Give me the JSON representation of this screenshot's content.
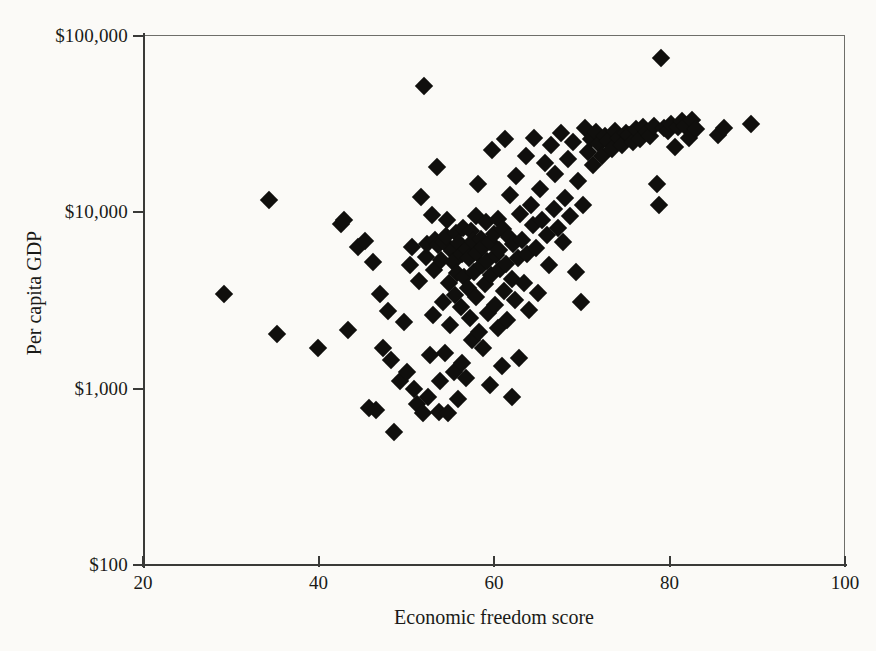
{
  "chart_data": {
    "type": "scatter",
    "title": "",
    "xlabel": "Economic freedom score",
    "ylabel": "Per capita GDP",
    "xlim": [
      20,
      100
    ],
    "ylim": [
      100,
      100000
    ],
    "yscale": "log",
    "xscale": "linear",
    "grid": false,
    "legend": null,
    "marker": "diamond",
    "marker_color": "#100f0d",
    "xticks": [
      20,
      40,
      60,
      80,
      100
    ],
    "xtick_labels": [
      "20",
      "40",
      "60",
      "80",
      "100"
    ],
    "yticks": [
      100,
      1000,
      10000,
      100000
    ],
    "ytick_labels": [
      "$100",
      "$1,000",
      "$10,000",
      "$100,000"
    ],
    "n_points": 178,
    "points": [
      [
        29.2,
        3450
      ],
      [
        34.4,
        11800
      ],
      [
        35.3,
        2050
      ],
      [
        39.9,
        1700
      ],
      [
        42.6,
        8600
      ],
      [
        42.9,
        9000
      ],
      [
        43.4,
        2150
      ],
      [
        44.5,
        6400
      ],
      [
        45.3,
        6900
      ],
      [
        45.7,
        780
      ],
      [
        46.2,
        5200
      ],
      [
        46.6,
        760
      ],
      [
        47.0,
        3450
      ],
      [
        47.4,
        1700
      ],
      [
        47.9,
        2750
      ],
      [
        48.3,
        1450
      ],
      [
        48.6,
        570
      ],
      [
        49.3,
        1100
      ],
      [
        49.8,
        2400
      ],
      [
        50.1,
        1250
      ],
      [
        50.4,
        5000
      ],
      [
        50.6,
        6400
      ],
      [
        50.9,
        1000
      ],
      [
        51.2,
        820
      ],
      [
        51.5,
        4100
      ],
      [
        51.7,
        12200
      ],
      [
        51.9,
        730
      ],
      [
        52.0,
        52000
      ],
      [
        52.2,
        5600
      ],
      [
        52.4,
        6600
      ],
      [
        52.5,
        900
      ],
      [
        52.7,
        1550
      ],
      [
        52.9,
        9600
      ],
      [
        53.0,
        2600
      ],
      [
        53.2,
        4700
      ],
      [
        53.3,
        7000
      ],
      [
        53.5,
        18000
      ],
      [
        53.6,
        6500
      ],
      [
        53.7,
        740
      ],
      [
        53.9,
        1100
      ],
      [
        54.0,
        5400
      ],
      [
        54.2,
        3100
      ],
      [
        54.3,
        6800
      ],
      [
        54.4,
        1600
      ],
      [
        54.5,
        7300
      ],
      [
        54.7,
        9000
      ],
      [
        54.8,
        730
      ],
      [
        54.9,
        4000
      ],
      [
        55.0,
        2300
      ],
      [
        55.2,
        6000
      ],
      [
        55.3,
        5200
      ],
      [
        55.4,
        1250
      ],
      [
        55.6,
        3400
      ],
      [
        55.7,
        7600
      ],
      [
        55.8,
        4500
      ],
      [
        55.9,
        870
      ],
      [
        56.0,
        6700
      ],
      [
        56.2,
        2900
      ],
      [
        56.3,
        5800
      ],
      [
        56.4,
        1400
      ],
      [
        56.5,
        8200
      ],
      [
        56.6,
        4300
      ],
      [
        56.8,
        1150
      ],
      [
        56.9,
        6200
      ],
      [
        57.0,
        3700
      ],
      [
        57.1,
        5500
      ],
      [
        57.3,
        2500
      ],
      [
        57.4,
        7800
      ],
      [
        57.5,
        1900
      ],
      [
        57.6,
        6900
      ],
      [
        57.7,
        4600
      ],
      [
        57.9,
        9500
      ],
      [
        58.0,
        3300
      ],
      [
        58.1,
        5900
      ],
      [
        58.2,
        14500
      ],
      [
        58.3,
        2100
      ],
      [
        58.5,
        7100
      ],
      [
        58.6,
        5000
      ],
      [
        58.7,
        1700
      ],
      [
        58.8,
        6400
      ],
      [
        59.0,
        3900
      ],
      [
        59.1,
        8800
      ],
      [
        59.2,
        5300
      ],
      [
        59.3,
        2700
      ],
      [
        59.5,
        6800
      ],
      [
        59.6,
        1050
      ],
      [
        59.7,
        4400
      ],
      [
        59.8,
        22500
      ],
      [
        60.0,
        7500
      ],
      [
        60.1,
        3000
      ],
      [
        60.2,
        5700
      ],
      [
        60.4,
        9200
      ],
      [
        60.5,
        2200
      ],
      [
        60.6,
        6100
      ],
      [
        60.7,
        4800
      ],
      [
        60.9,
        1350
      ],
      [
        61.0,
        8000
      ],
      [
        61.1,
        3600
      ],
      [
        61.3,
        26000
      ],
      [
        61.4,
        5100
      ],
      [
        61.5,
        2450
      ],
      [
        61.7,
        7200
      ],
      [
        61.8,
        12500
      ],
      [
        62.0,
        4200
      ],
      [
        62.1,
        900
      ],
      [
        62.2,
        6600
      ],
      [
        62.4,
        3200
      ],
      [
        62.5,
        16000
      ],
      [
        62.7,
        5500
      ],
      [
        62.8,
        1500
      ],
      [
        63.0,
        9800
      ],
      [
        63.2,
        7000
      ],
      [
        63.4,
        4000
      ],
      [
        63.6,
        21000
      ],
      [
        63.8,
        5800
      ],
      [
        64.0,
        2800
      ],
      [
        64.2,
        11000
      ],
      [
        64.4,
        8500
      ],
      [
        64.6,
        26500
      ],
      [
        64.8,
        6300
      ],
      [
        65.0,
        3500
      ],
      [
        65.2,
        13500
      ],
      [
        65.5,
        9000
      ],
      [
        65.8,
        19000
      ],
      [
        66.0,
        7400
      ],
      [
        66.3,
        5000
      ],
      [
        66.5,
        24000
      ],
      [
        66.8,
        10500
      ],
      [
        67.0,
        16500
      ],
      [
        67.3,
        8200
      ],
      [
        67.6,
        28000
      ],
      [
        67.9,
        6800
      ],
      [
        68.1,
        12000
      ],
      [
        68.4,
        20000
      ],
      [
        68.7,
        9500
      ],
      [
        69.0,
        25000
      ],
      [
        69.3,
        4600
      ],
      [
        69.6,
        15000
      ],
      [
        69.9,
        3100
      ],
      [
        70.1,
        11000
      ],
      [
        70.4,
        30000
      ],
      [
        70.7,
        22000
      ],
      [
        71.0,
        26000
      ],
      [
        71.3,
        18500
      ],
      [
        71.6,
        28500
      ],
      [
        72.0,
        24500
      ],
      [
        72.3,
        21000
      ],
      [
        72.6,
        27000
      ],
      [
        73.0,
        25500
      ],
      [
        73.4,
        23000
      ],
      [
        73.8,
        29000
      ],
      [
        74.2,
        26500
      ],
      [
        74.6,
        24000
      ],
      [
        75.0,
        28000
      ],
      [
        75.4,
        27500
      ],
      [
        75.8,
        25000
      ],
      [
        76.2,
        29500
      ],
      [
        76.6,
        26000
      ],
      [
        77.0,
        30500
      ],
      [
        77.4,
        28500
      ],
      [
        77.8,
        27000
      ],
      [
        78.2,
        31000
      ],
      [
        78.6,
        14500
      ],
      [
        78.8,
        11000
      ],
      [
        79.0,
        75000
      ],
      [
        79.4,
        30000
      ],
      [
        79.8,
        29000
      ],
      [
        80.2,
        31500
      ],
      [
        80.6,
        23500
      ],
      [
        81.0,
        30500
      ],
      [
        81.4,
        33000
      ],
      [
        81.8,
        31000
      ],
      [
        82.2,
        26500
      ],
      [
        82.6,
        33500
      ],
      [
        83.0,
        29500
      ],
      [
        85.5,
        27500
      ],
      [
        86.2,
        30000
      ],
      [
        89.3,
        31500
      ]
    ]
  },
  "axes": {
    "ylabel": "Per capita GDP",
    "xlabel": "Economic freedom score",
    "ytick_labels": [
      "$100,000",
      "$10,000",
      "$1,000",
      "$100"
    ],
    "xtick_labels": [
      "20",
      "40",
      "60",
      "80",
      "100"
    ]
  }
}
